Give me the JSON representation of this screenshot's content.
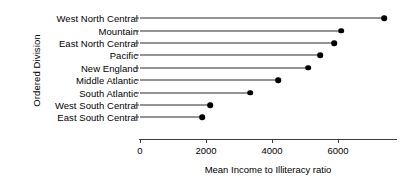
{
  "chart_data": {
    "type": "scatter",
    "subtype": "lollipop-dot-plot",
    "title": "",
    "xlabel": "Mean Income to Illiteracy ratio",
    "ylabel": "Ordered Division",
    "orientation": "horizontal",
    "categories": [
      "West North Central",
      "Mountain",
      "East North Central",
      "Pacific",
      "New England",
      "Middle Atlantic",
      "South Atlantic",
      "West South Central",
      "East South Central"
    ],
    "values": [
      7394,
      6091,
      5879,
      5455,
      5091,
      4182,
      3333,
      2121,
      1879
    ],
    "xlim": [
      0,
      7800
    ],
    "ylim": [
      0,
      10
    ],
    "xticks": [
      0,
      2000,
      4000,
      6000
    ],
    "xtick_labels": [
      "0",
      "2000",
      "4000",
      "6000"
    ],
    "grid": false,
    "legend": false,
    "legend_position": "none",
    "baseline": 0,
    "marker_color": "#000000",
    "stem_color": "#2b2b2b",
    "axis_color": "#3c3c3c",
    "background": "#ffffff"
  }
}
